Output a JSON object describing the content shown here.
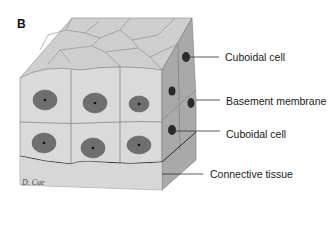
{
  "figure": {
    "panel_letter": "B",
    "signature": "D. Cue",
    "labels": [
      {
        "id": "cuboidal-cell-top",
        "text": "Cuboidal cell"
      },
      {
        "id": "basement-membrane",
        "text": "Basement membrane"
      },
      {
        "id": "cuboidal-cell-bottom",
        "text": "Cuboidal cell"
      },
      {
        "id": "connective-tissue",
        "text": "Connective tissue"
      }
    ],
    "colors": {
      "top_face": "#cfcfcf",
      "front_face": "#dadada",
      "side_face": "#a9a9a9",
      "nucleus": "#6f6f6f",
      "membrane": "#2a2a2a",
      "connective": "#d6d6d6"
    }
  }
}
